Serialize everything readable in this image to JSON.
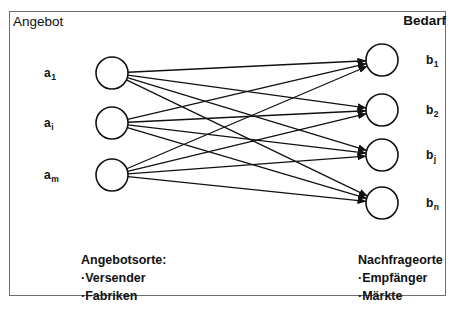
{
  "diagram": {
    "title_left": "Angebot",
    "title_right": "Bedarf",
    "supply_nodes": [
      {
        "id": "a1",
        "label_base": "a",
        "label_sub": "1",
        "cx": 112,
        "cy": 73
      },
      {
        "id": "ai",
        "label_base": "a",
        "label_sub": "i",
        "cx": 112,
        "cy": 123
      },
      {
        "id": "am",
        "label_base": "a",
        "label_sub": "m",
        "cx": 112,
        "cy": 175
      }
    ],
    "demand_nodes": [
      {
        "id": "b1",
        "label_base": "b",
        "label_sub": "1",
        "cx": 382,
        "cy": 60
      },
      {
        "id": "b2",
        "label_base": "b",
        "label_sub": "2",
        "cx": 382,
        "cy": 110
      },
      {
        "id": "bj",
        "label_base": "b",
        "label_sub": "j",
        "cx": 382,
        "cy": 155
      },
      {
        "id": "bn",
        "label_base": "b",
        "label_sub": "n",
        "cx": 382,
        "cy": 203
      }
    ],
    "node_radius": 16,
    "edges": [
      {
        "from": "a1",
        "to": "b1"
      },
      {
        "from": "a1",
        "to": "b2"
      },
      {
        "from": "a1",
        "to": "bj"
      },
      {
        "from": "a1",
        "to": "bn"
      },
      {
        "from": "ai",
        "to": "b1"
      },
      {
        "from": "ai",
        "to": "b2"
      },
      {
        "from": "ai",
        "to": "bj"
      },
      {
        "from": "ai",
        "to": "bn"
      },
      {
        "from": "am",
        "to": "b1"
      },
      {
        "from": "am",
        "to": "b2"
      },
      {
        "from": "am",
        "to": "bj"
      },
      {
        "from": "am",
        "to": "bn"
      }
    ],
    "edge_count": 12,
    "graph_type": "complete-bipartite",
    "stroke_color": "#111111",
    "frame_color": "#6e6e6e"
  },
  "captions": {
    "left": {
      "heading": "Angebotsorte:",
      "items": [
        "·Versender",
        "·Fabriken"
      ]
    },
    "right": {
      "heading": "Nachfrageorte",
      "items": [
        "·Empfänger",
        "·Märkte"
      ]
    }
  }
}
